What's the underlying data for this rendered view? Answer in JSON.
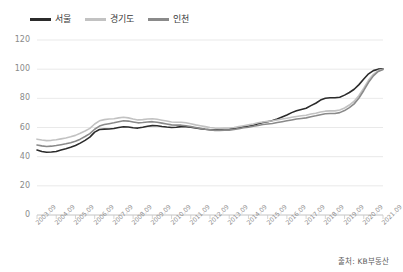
{
  "chart_data": {
    "type": "line",
    "title": "",
    "subtitle": "",
    "xlabel": "",
    "ylabel": "",
    "ylim": [
      0,
      120
    ],
    "yticks": [
      0,
      20,
      40,
      60,
      80,
      100,
      120
    ],
    "grid": true,
    "legend_position": "top-left",
    "source": "출처: KB부동산",
    "xtick_labels": [
      "2003.09",
      "2004.09",
      "2005.09",
      "2006.09",
      "2007.09",
      "2008.09",
      "2009.09",
      "2010.09",
      "2011.09",
      "2012.09",
      "2013.09",
      "2014.09",
      "2015.09",
      "2016.09",
      "2017.09",
      "2018.09",
      "2019.09",
      "2020.09",
      "2021.09"
    ],
    "x": [
      2003.75,
      2004.0,
      2004.25,
      2004.5,
      2004.75,
      2005.0,
      2005.25,
      2005.5,
      2005.75,
      2006.0,
      2006.25,
      2006.5,
      2006.75,
      2007.0,
      2007.25,
      2007.5,
      2007.75,
      2008.0,
      2008.25,
      2008.5,
      2008.75,
      2009.0,
      2009.25,
      2009.5,
      2009.75,
      2010.0,
      2010.25,
      2010.5,
      2010.75,
      2011.0,
      2011.25,
      2011.5,
      2011.75,
      2012.0,
      2012.25,
      2012.5,
      2012.75,
      2013.0,
      2013.25,
      2013.5,
      2013.75,
      2014.0,
      2014.25,
      2014.5,
      2014.75,
      2015.0,
      2015.25,
      2015.5,
      2015.75,
      2016.0,
      2016.25,
      2016.5,
      2016.75,
      2017.0,
      2017.25,
      2017.5,
      2017.75,
      2018.0,
      2018.25,
      2018.5,
      2018.75,
      2019.0,
      2019.25,
      2019.5,
      2019.75,
      2020.0,
      2020.25,
      2020.5,
      2020.75,
      2021.0,
      2021.25,
      2021.5,
      2021.75
    ],
    "series": [
      {
        "name": "서울",
        "color": "#2b2b2b",
        "width": 1.6,
        "values": [
          44.5,
          43.5,
          43.0,
          43.2,
          43.6,
          44.6,
          45.4,
          46.4,
          47.6,
          49.3,
          51.2,
          53.4,
          56.8,
          58.6,
          58.9,
          59.0,
          59.3,
          60.0,
          60.5,
          60.3,
          59.8,
          59.6,
          60.2,
          60.9,
          61.3,
          61.2,
          60.7,
          60.3,
          60.0,
          60.2,
          60.6,
          60.5,
          60.2,
          59.6,
          59.2,
          58.8,
          58.5,
          58.3,
          58.6,
          59.0,
          59.0,
          59.4,
          60.0,
          60.6,
          61.0,
          61.6,
          62.6,
          63.4,
          64.0,
          64.8,
          65.8,
          67.2,
          68.6,
          70.2,
          71.5,
          72.4,
          73.2,
          75.0,
          76.6,
          78.8,
          80.0,
          80.4,
          80.4,
          80.8,
          82.2,
          84.0,
          86.2,
          89.4,
          93.2,
          96.8,
          99.0,
          100.0,
          100.2
        ]
      },
      {
        "name": "경기도",
        "color": "#c2c2c2",
        "width": 1.6,
        "values": [
          52.0,
          51.4,
          51.0,
          51.2,
          51.6,
          52.2,
          52.8,
          53.6,
          54.6,
          56.0,
          57.6,
          59.4,
          62.4,
          64.6,
          65.4,
          65.8,
          66.0,
          66.6,
          67.0,
          66.6,
          65.8,
          65.2,
          65.4,
          65.8,
          66.0,
          65.6,
          65.0,
          64.4,
          63.8,
          63.6,
          63.6,
          63.2,
          62.6,
          61.8,
          61.2,
          60.6,
          60.0,
          59.6,
          59.4,
          59.6,
          59.6,
          60.0,
          60.6,
          61.2,
          61.8,
          62.4,
          63.2,
          63.8,
          64.2,
          64.6,
          65.2,
          65.8,
          66.4,
          67.0,
          67.6,
          68.0,
          68.4,
          69.2,
          69.8,
          70.6,
          71.2,
          71.4,
          71.4,
          72.0,
          73.4,
          75.4,
          78.0,
          82.0,
          87.0,
          92.5,
          96.5,
          99.0,
          100.0
        ]
      },
      {
        "name": "인천",
        "color": "#8a8a8a",
        "width": 1.6,
        "values": [
          48.0,
          47.4,
          47.0,
          47.2,
          47.6,
          48.2,
          48.8,
          49.6,
          50.6,
          52.0,
          53.8,
          55.8,
          58.8,
          61.0,
          62.0,
          62.6,
          63.2,
          64.0,
          64.6,
          64.4,
          63.8,
          63.2,
          63.4,
          63.8,
          64.0,
          63.6,
          63.0,
          62.4,
          61.8,
          61.6,
          61.6,
          61.2,
          60.6,
          60.0,
          59.4,
          58.8,
          58.4,
          58.0,
          58.0,
          58.2,
          58.2,
          58.6,
          59.2,
          59.8,
          60.2,
          60.8,
          61.4,
          62.0,
          62.4,
          62.8,
          63.4,
          64.0,
          64.6,
          65.2,
          65.8,
          66.2,
          66.6,
          67.4,
          68.0,
          68.8,
          69.4,
          69.6,
          69.6,
          70.2,
          71.6,
          73.6,
          76.2,
          80.2,
          85.4,
          91.0,
          95.4,
          98.4,
          99.8
        ]
      }
    ]
  },
  "legend": {
    "items": [
      {
        "label": "서울",
        "color": "#2b2b2b"
      },
      {
        "label": "경기도",
        "color": "#c2c2c2"
      },
      {
        "label": "인천",
        "color": "#8a8a8a"
      }
    ]
  },
  "footer": {
    "source": "출처: KB부동산"
  }
}
